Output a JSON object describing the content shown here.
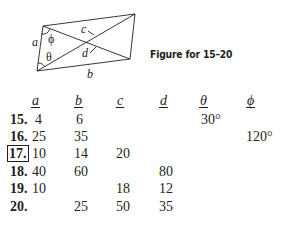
{
  "figure": {
    "caption": "Figure for 15–20",
    "labels": {
      "a": "a",
      "b": "b",
      "c": "c",
      "d": "d",
      "theta": "θ",
      "phi": "ϕ"
    }
  },
  "table": {
    "headers": [
      "a",
      "b",
      "c",
      "d",
      "θ",
      "ϕ"
    ],
    "rows": [
      {
        "num": "15.",
        "boxed": false,
        "a": "4",
        "b": "6",
        "c": "",
        "d": "",
        "theta": "30°",
        "phi": ""
      },
      {
        "num": "16.",
        "boxed": false,
        "a": "25",
        "b": "35",
        "c": "",
        "d": "",
        "theta": "",
        "phi": "120°"
      },
      {
        "num": "17.",
        "boxed": true,
        "a": "10",
        "b": "14",
        "c": "20",
        "d": "",
        "theta": "",
        "phi": ""
      },
      {
        "num": "18.",
        "boxed": false,
        "a": "40",
        "b": "60",
        "c": "",
        "d": "80",
        "theta": "",
        "phi": ""
      },
      {
        "num": "19.",
        "boxed": false,
        "a": "10",
        "b": "",
        "c": "18",
        "d": "12",
        "theta": "",
        "phi": ""
      },
      {
        "num": "20.",
        "boxed": false,
        "a": "",
        "b": "25",
        "c": "50",
        "d": "35",
        "theta": "",
        "phi": ""
      }
    ]
  }
}
